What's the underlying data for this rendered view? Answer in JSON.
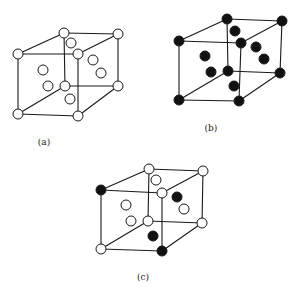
{
  "figure": {
    "colors": {
      "open_atom_fill": "#ffffff",
      "filled_atom_fill": "#111111",
      "edge": "#1a1a1a"
    },
    "panels": [
      {
        "id": "a",
        "label": "(a)",
        "label_pos": [
          44,
          145
        ],
        "corners": {
          "btl": [
            64,
            33,
            "open"
          ],
          "btr": [
            118,
            34,
            "open"
          ],
          "ftl": [
            18,
            54,
            "open"
          ],
          "ftr": [
            78,
            54,
            "open"
          ],
          "bbl": [
            65,
            86,
            "open"
          ],
          "bbr": [
            118,
            86,
            "open"
          ],
          "fbl": [
            18,
            114,
            "open"
          ],
          "fbr": [
            78,
            116,
            "open"
          ]
        },
        "face_centers": [
          [
            71,
            43,
            "open"
          ],
          [
            43,
            70,
            "open"
          ],
          [
            48,
            86,
            "open"
          ],
          [
            93,
            60,
            "open"
          ],
          [
            101,
            73,
            "open"
          ],
          [
            70,
            99,
            "open"
          ]
        ]
      },
      {
        "id": "b",
        "label": "(b)",
        "label_pos": [
          211,
          131
        ],
        "corners": {
          "btl": [
            227,
            19,
            "filled"
          ],
          "btr": [
            282,
            21,
            "filled"
          ],
          "ftl": [
            179,
            41,
            "filled"
          ],
          "ftr": [
            241,
            43,
            "filled"
          ],
          "bbl": [
            228,
            71,
            "filled"
          ],
          "bbr": [
            280,
            73,
            "filled"
          ],
          "fbl": [
            179,
            100,
            "filled"
          ],
          "fbr": [
            239,
            101,
            "filled"
          ]
        },
        "face_centers": [
          [
            235,
            31,
            "filled"
          ],
          [
            205,
            56,
            "filled"
          ],
          [
            211,
            72,
            "filled"
          ],
          [
            256,
            47,
            "filled"
          ],
          [
            264,
            59,
            "filled"
          ],
          [
            234,
            86,
            "filled"
          ]
        ]
      },
      {
        "id": "c",
        "label": "(c)",
        "label_pos": [
          143,
          280
        ],
        "corners": {
          "btl": [
            149,
            169,
            "open"
          ],
          "btr": [
            203,
            171,
            "open"
          ],
          "ftl": [
            101,
            190,
            "filled"
          ],
          "ftr": [
            162,
            193,
            "open"
          ],
          "bbl": [
            148,
            221,
            "open"
          ],
          "bbr": [
            202,
            223,
            "open"
          ],
          "fbl": [
            101,
            249,
            "open"
          ],
          "fbr": [
            162,
            251,
            "filled"
          ]
        },
        "face_centers": [
          [
            156,
            180,
            "open"
          ],
          [
            126,
            205,
            "open"
          ],
          [
            131,
            221,
            "open"
          ],
          [
            177,
            197,
            "filled"
          ],
          [
            184,
            209,
            "open"
          ],
          [
            153,
            236,
            "filled"
          ]
        ]
      }
    ]
  }
}
